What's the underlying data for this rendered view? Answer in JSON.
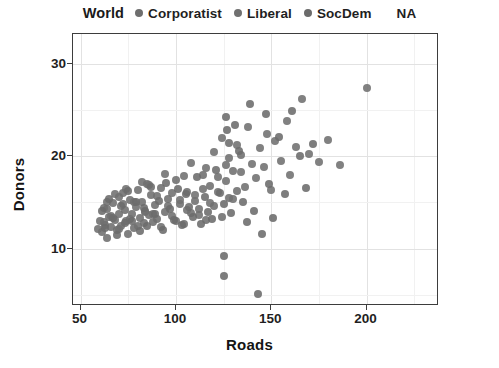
{
  "legend": {
    "title": "World",
    "entries": [
      {
        "label": "Corporatist",
        "color": "#6e6e6e",
        "has_key": true
      },
      {
        "label": "Liberal",
        "color": "#707070",
        "has_key": true
      },
      {
        "label": "SocDem",
        "color": "#6b6b6b",
        "has_key": true
      },
      {
        "label": "NA",
        "color": "#bdbdbd",
        "has_key": false
      }
    ],
    "position": "top"
  },
  "axes": {
    "x": {
      "label": "Roads",
      "ticks": [
        50,
        100,
        150,
        200
      ],
      "tick_labels": [
        "50",
        "100",
        "150",
        "200"
      ],
      "range": [
        46,
        238
      ]
    },
    "y": {
      "label": "Donors",
      "ticks": [
        10,
        20,
        30
      ],
      "tick_labels": [
        "10",
        "20",
        "30"
      ],
      "range": [
        3.8,
        33.2
      ]
    },
    "grid": true
  },
  "style": {
    "panel_background": "#ffffff",
    "panel_border": "#3d3d3d",
    "grid_major": "#e2e2e2",
    "grid_minor": "#f1f1f1",
    "text_color": "#1f1f1f",
    "point_opacity": 0.88
  },
  "chart_data": {
    "type": "scatter",
    "title": "",
    "subtitle": "",
    "xlabel": "Roads",
    "ylabel": "Donors",
    "xlim": [
      46,
      238
    ],
    "ylim": [
      3.8,
      33.2
    ],
    "grid": true,
    "legend_title": "World",
    "legend_position": "top",
    "color_by": "World",
    "groups": [
      "Corporatist",
      "Liberal",
      "SocDem",
      "NA"
    ],
    "group_colors": {
      "Corporatist": "#6e6e6e",
      "Liberal": "#707070",
      "SocDem": "#6b6b6b",
      "NA": "#bdbdbd"
    },
    "n_points": 200,
    "series": [
      {
        "name": "Corporatist",
        "color": "#6e6e6e",
        "points": [
          [
            59,
            12.1
          ],
          [
            60,
            13.0
          ],
          [
            61,
            11.8
          ],
          [
            62,
            14.4
          ],
          [
            63,
            12.6
          ],
          [
            64,
            15.1
          ],
          [
            64,
            11.2
          ],
          [
            65,
            13.4
          ],
          [
            66,
            12.3
          ],
          [
            67,
            14.9
          ],
          [
            68,
            13.1
          ],
          [
            69,
            12.0
          ],
          [
            70,
            15.6
          ],
          [
            70,
            13.8
          ],
          [
            71,
            12.4
          ],
          [
            72,
            16.0
          ],
          [
            73,
            14.2
          ],
          [
            74,
            13.0
          ],
          [
            75,
            11.6
          ],
          [
            76,
            15.3
          ],
          [
            77,
            13.7
          ],
          [
            78,
            12.2
          ],
          [
            79,
            14.5
          ],
          [
            80,
            16.3
          ],
          [
            81,
            13.3
          ],
          [
            82,
            15.0
          ],
          [
            83,
            12.8
          ],
          [
            84,
            14.1
          ],
          [
            85,
            17.0
          ],
          [
            86,
            13.6
          ],
          [
            87,
            15.8
          ],
          [
            88,
            12.9
          ],
          [
            89,
            14.7
          ],
          [
            90,
            13.2
          ],
          [
            92,
            16.6
          ],
          [
            94,
            14.0
          ],
          [
            96,
            15.4
          ],
          [
            98,
            13.5
          ],
          [
            100,
            17.4
          ],
          [
            102,
            14.8
          ],
          [
            104,
            12.7
          ],
          [
            106,
            16.1
          ],
          [
            108,
            13.9
          ],
          [
            110,
            15.2
          ],
          [
            112,
            14.3
          ],
          [
            114,
            18.0
          ],
          [
            116,
            13.1
          ],
          [
            118,
            16.8
          ],
          [
            120,
            14.6
          ],
          [
            122,
            17.7
          ],
          [
            124,
            13.4
          ],
          [
            126,
            19.0
          ],
          [
            128,
            15.5
          ],
          [
            130,
            18.4
          ],
          [
            132,
            16.2
          ],
          [
            134,
            20.1
          ]
        ]
      },
      {
        "name": "Liberal",
        "color": "#707070",
        "points": [
          [
            62,
            12.9
          ],
          [
            64,
            14.3
          ],
          [
            66,
            13.5
          ],
          [
            68,
            15.9
          ],
          [
            70,
            12.1
          ],
          [
            72,
            14.8
          ],
          [
            74,
            16.4
          ],
          [
            76,
            13.2
          ],
          [
            78,
            15.1
          ],
          [
            80,
            12.5
          ],
          [
            82,
            17.2
          ],
          [
            84,
            14.0
          ],
          [
            86,
            16.9
          ],
          [
            88,
            13.8
          ],
          [
            90,
            15.7
          ],
          [
            92,
            12.3
          ],
          [
            94,
            18.1
          ],
          [
            96,
            14.6
          ],
          [
            98,
            16.0
          ],
          [
            100,
            13.0
          ],
          [
            102,
            15.3
          ],
          [
            104,
            17.9
          ],
          [
            106,
            14.2
          ],
          [
            108,
            19.3
          ],
          [
            110,
            15.8
          ],
          [
            112,
            13.6
          ],
          [
            114,
            16.5
          ],
          [
            116,
            18.7
          ],
          [
            118,
            14.9
          ],
          [
            120,
            20.4
          ],
          [
            122,
            16.1
          ],
          [
            124,
            22.0
          ],
          [
            126,
            17.3
          ],
          [
            128,
            19.8
          ],
          [
            130,
            15.4
          ],
          [
            132,
            21.2
          ],
          [
            134,
            18.3
          ],
          [
            136,
            16.7
          ],
          [
            138,
            23.1
          ],
          [
            140,
            19.1
          ],
          [
            142,
            17.6
          ],
          [
            144,
            20.9
          ],
          [
            146,
            18.8
          ],
          [
            148,
            22.4
          ],
          [
            150,
            16.3
          ],
          [
            152,
            21.6
          ],
          [
            155,
            19.5
          ],
          [
            158,
            23.8
          ],
          [
            160,
            18.0
          ],
          [
            163,
            21.0
          ],
          [
            166,
            26.2
          ],
          [
            170,
            20.2
          ],
          [
            175,
            19.4
          ],
          [
            180,
            21.8
          ],
          [
            186,
            19.0
          ],
          [
            200,
            27.4
          ]
        ]
      },
      {
        "name": "SocDem",
        "color": "#6b6b6b",
        "points": [
          [
            61,
            14.1
          ],
          [
            63,
            12.2
          ],
          [
            65,
            15.4
          ],
          [
            67,
            13.3
          ],
          [
            69,
            11.5
          ],
          [
            71,
            14.6
          ],
          [
            73,
            12.8
          ],
          [
            75,
            16.2
          ],
          [
            77,
            13.0
          ],
          [
            79,
            15.0
          ],
          [
            81,
            11.9
          ],
          [
            83,
            14.4
          ],
          [
            85,
            12.4
          ],
          [
            87,
            16.7
          ],
          [
            89,
            13.7
          ],
          [
            91,
            15.2
          ],
          [
            93,
            12.0
          ],
          [
            95,
            17.1
          ],
          [
            97,
            14.3
          ],
          [
            99,
            13.1
          ],
          [
            101,
            16.4
          ],
          [
            103,
            12.6
          ],
          [
            105,
            15.9
          ],
          [
            107,
            14.5
          ],
          [
            109,
            13.4
          ],
          [
            111,
            17.8
          ],
          [
            113,
            12.7
          ],
          [
            115,
            15.6
          ],
          [
            117,
            14.0
          ],
          [
            119,
            13.2
          ],
          [
            121,
            18.5
          ],
          [
            123,
            16.0
          ],
          [
            125,
            14.8
          ],
          [
            125,
            9.2
          ],
          [
            125,
            7.0
          ],
          [
            126,
            24.2
          ],
          [
            127,
            22.8
          ],
          [
            128,
            21.4
          ],
          [
            129,
            13.9
          ],
          [
            131,
            23.4
          ],
          [
            133,
            20.6
          ],
          [
            135,
            15.0
          ],
          [
            137,
            12.9
          ],
          [
            139,
            25.6
          ],
          [
            141,
            14.1
          ],
          [
            143,
            5.1
          ],
          [
            145,
            11.6
          ],
          [
            147,
            24.6
          ],
          [
            149,
            17.0
          ],
          [
            151,
            13.3
          ],
          [
            154,
            22.1
          ],
          [
            157,
            15.9
          ],
          [
            161,
            24.9
          ],
          [
            165,
            20.0
          ],
          [
            168,
            16.6
          ],
          [
            172,
            21.3
          ]
        ]
      },
      {
        "name": "NA",
        "color": "#bdbdbd",
        "points": []
      }
    ]
  }
}
